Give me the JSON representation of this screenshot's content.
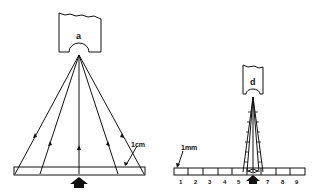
{
  "figure": {
    "left_panel": {
      "lens_label": "a",
      "scale_label": "1cm",
      "description": "Wide ray fan from objective to 1 cm specimen field"
    },
    "right_panel": {
      "lens_label": "d",
      "scale_label": "1mm",
      "ruler_ticks": [
        "1",
        "2",
        "3",
        "4",
        "5",
        "6",
        "7",
        "8",
        "9"
      ],
      "description": "Narrow ray cone from objective onto 1 mm graduated scale"
    },
    "colors": {
      "ink": "#111111",
      "background": "#ffffff"
    }
  }
}
